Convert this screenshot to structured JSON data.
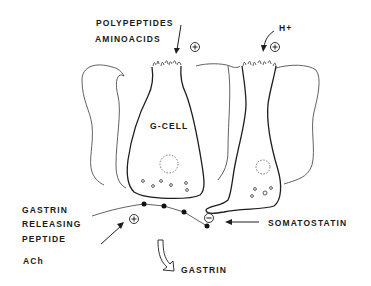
{
  "diagram": {
    "type": "physiology-schematic",
    "cells": [
      {
        "name": "G-CELL",
        "role": "gastrin-secreting cell"
      },
      {
        "name": "",
        "role": "somatostatin-secreting D-cell (unlabeled, right)"
      }
    ],
    "labels": {
      "polypeptides": "POLYPEPTIDES",
      "aminoacids": "AMINOACIDS",
      "h_plus": "H+",
      "g_cell": "G-CELL",
      "grp_line1": "GASTRIN",
      "grp_line2": "RELEASING",
      "grp_line3": "PEPTIDE",
      "ach": "ACh",
      "somatostatin": "SOMATOSTATIN",
      "gastrin": "GASTRIN"
    },
    "signs": {
      "luminal_stimulus": "+",
      "acid_stimulus": "+",
      "neural_stimulus": "+",
      "somatostatin_effect": "−"
    },
    "edges": [
      {
        "from": "POLYPEPTIDES / AMINOACIDS",
        "to": "G-CELL apical surface",
        "sign": "+"
      },
      {
        "from": "H+",
        "to": "D-cell apical surface",
        "sign": "+"
      },
      {
        "from": "GASTRIN RELEASING PEPTIDE / ACh",
        "to": "G-CELL basal nerve",
        "sign": "+"
      },
      {
        "from": "SOMATOSTATIN (D-cell process)",
        "to": "G-CELL",
        "sign": "−"
      },
      {
        "from": "G-CELL",
        "to": "GASTRIN (released)",
        "sign": ""
      }
    ]
  }
}
